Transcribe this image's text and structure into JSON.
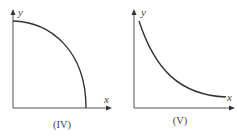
{
  "graphs": [
    {
      "id": "IV",
      "caption": "(IV)",
      "x_label": "x",
      "y_label": "y",
      "curve": "concave-down decreasing (quarter-ellipse) from y-intercept to x-intercept"
    },
    {
      "id": "V",
      "caption": "(V)",
      "x_label": "x",
      "y_label": "y",
      "curve": "convex decreasing (hyperbola/exponential decay) approaching x-axis"
    }
  ],
  "colors": {
    "axis": "#555555",
    "curve": "#333333",
    "text": "#444444"
  }
}
